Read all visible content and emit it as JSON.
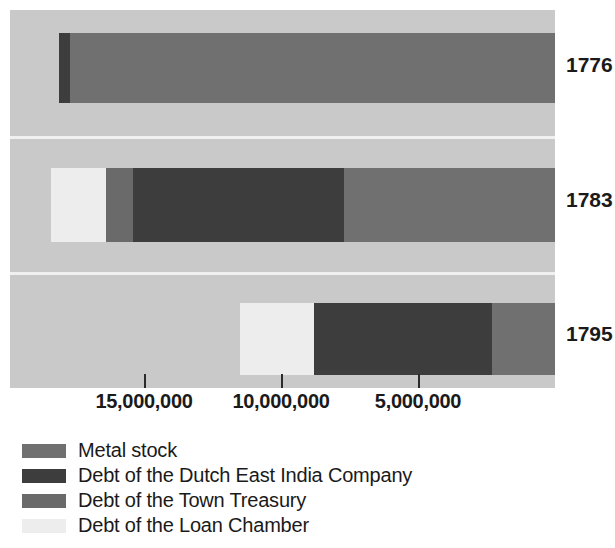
{
  "chart_data": {
    "type": "bar",
    "orientation": "horizontal-stacked",
    "title": "",
    "xlabel": "",
    "ylabel": "",
    "axis_reversed": true,
    "grid": false,
    "legend_position": "bottom-left",
    "categories": [
      "1776",
      "1783",
      "1795"
    ],
    "tick_labels": [
      "15,000,000",
      "10,000,000",
      "5,000,000"
    ],
    "tick_values": [
      15000000,
      10000000,
      5000000
    ],
    "xlim": [
      18500000,
      0
    ],
    "series": [
      {
        "name": "Metal stock",
        "color": "#707070",
        "values": [
          17700000,
          7700000,
          2300000
        ]
      },
      {
        "name": "Debt of the Dutch East India Company",
        "color": "#3d3d3d",
        "values": [
          400000,
          7700000,
          6500000
        ]
      },
      {
        "name": "Debt of the Town Treasury",
        "color": "#6a6a6a",
        "values": [
          0,
          1000000,
          0
        ]
      },
      {
        "name": "Debt of the Loan Chamber",
        "color": "#ededed",
        "values": [
          0,
          2000000,
          2700000
        ]
      }
    ],
    "totals": [
      18100000,
      18400000,
      11500000
    ]
  },
  "legend": {
    "items": [
      {
        "label": "Metal stock",
        "color": "#707070"
      },
      {
        "label": "Debt of the Dutch East India Company",
        "color": "#3d3d3d"
      },
      {
        "label": "Debt of the Town Treasury",
        "color": "#6a6a6a"
      },
      {
        "label": "Debt of the Loan Chamber",
        "color": "#ededed"
      }
    ]
  },
  "style": {
    "plot_background": "#c9c9c9",
    "page_background": "#ffffff",
    "text_color": "#1a1a1a",
    "divider_color": "#f0f0f0"
  },
  "geometry": {
    "plot": {
      "left": 10,
      "top": 10,
      "width": 545,
      "height": 378
    },
    "axis_zero_x": 545,
    "px_per_unit": 2.74e-05,
    "rows": [
      {
        "top": 23,
        "height": 70
      },
      {
        "top": 158,
        "height": 74
      },
      {
        "top": 293,
        "height": 72
      }
    ],
    "dividers": [
      126,
      262
    ],
    "year_label_tops": [
      53,
      188,
      322
    ],
    "ticks_x": [
      144,
      281,
      418
    ]
  }
}
